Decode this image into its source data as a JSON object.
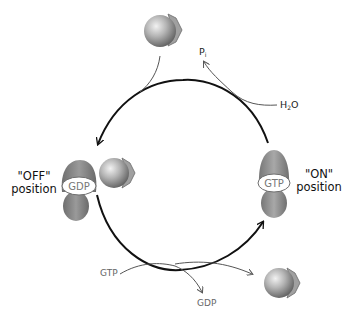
{
  "diagram": {
    "type": "cycle",
    "states": {
      "off": {
        "label_line1": "\"OFF\"",
        "label_line2": "position",
        "nucleotide": "GDP"
      },
      "on": {
        "label_line1": "\"ON\"",
        "label_line2": "position",
        "nucleotide": "GTP"
      }
    },
    "molecules": {
      "hydrolysis_input": "H",
      "hydrolysis_input_sub": "2",
      "hydrolysis_input_tail": "O",
      "hydrolysis_output": "P",
      "hydrolysis_output_sub": "i",
      "exchange_input": "GTP",
      "exchange_output": "GDP"
    },
    "colors": {
      "protein_dark": "#7a7a7a",
      "protein_light": "#c8c8c8",
      "sphere_light": "#e6e6e6",
      "sphere_dark": "#6a6a6a",
      "chevron": "#8f8f8f",
      "main_arrow": "#111111",
      "side_arrow": "#555555",
      "label_grey": "#777777"
    }
  }
}
